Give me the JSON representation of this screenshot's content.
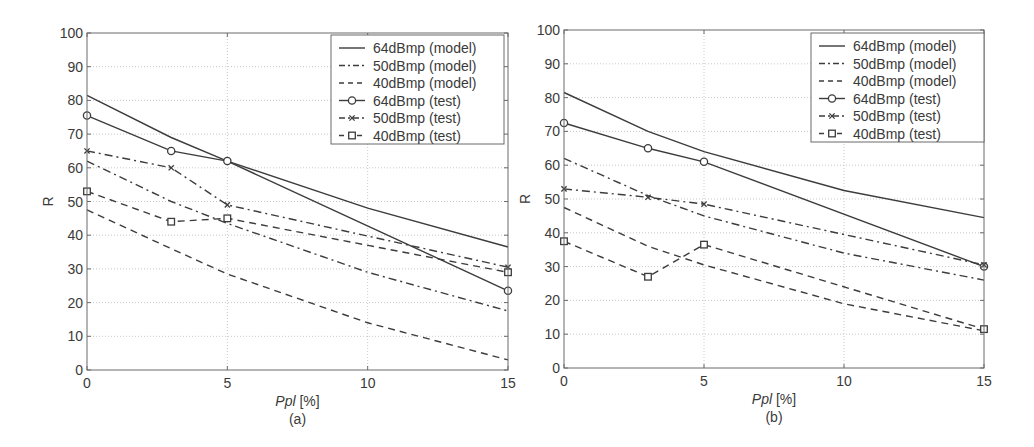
{
  "chart_data": [
    {
      "panel_label": "(a)",
      "type": "line",
      "title": "",
      "xlabel_italic": "Ppl",
      "xlabel_unit": " [%]",
      "ylabel": "R",
      "xlim": [
        0,
        15
      ],
      "ylim": [
        0,
        100
      ],
      "xticks": [
        0,
        5,
        10,
        15
      ],
      "yticks": [
        0,
        10,
        20,
        30,
        40,
        50,
        60,
        70,
        80,
        90,
        100
      ],
      "grid": true,
      "legend_position": "upper right",
      "series": [
        {
          "name": "64dBmp (model)",
          "style": "solid",
          "marker": "none",
          "x": [
            0,
            3,
            5,
            10,
            15
          ],
          "values": [
            81.5,
            69,
            62,
            48,
            36.5
          ]
        },
        {
          "name": "50dBmp (model)",
          "style": "dashdot",
          "marker": "none",
          "x": [
            0,
            3,
            5,
            10,
            15
          ],
          "values": [
            62,
            50,
            43.5,
            29,
            17.5
          ]
        },
        {
          "name": "40dBmp (model)",
          "style": "dashed",
          "marker": "none",
          "x": [
            0,
            3,
            5,
            10,
            15
          ],
          "values": [
            47.5,
            36,
            28.5,
            14,
            3
          ]
        },
        {
          "name": "64dBmp (test)",
          "style": "solid",
          "marker": "circle",
          "x": [
            0,
            3,
            5,
            15
          ],
          "values": [
            75.5,
            65,
            62,
            23.5
          ]
        },
        {
          "name": "50dBmp (test)",
          "style": "dashdot",
          "marker": "x",
          "x": [
            0,
            3,
            5,
            15
          ],
          "values": [
            65,
            60,
            49,
            30.5
          ]
        },
        {
          "name": "40dBmp (test)",
          "style": "dashed",
          "marker": "square",
          "x": [
            0,
            3,
            5,
            15
          ],
          "values": [
            53,
            44,
            45,
            29
          ]
        }
      ]
    },
    {
      "panel_label": "(b)",
      "type": "line",
      "title": "",
      "xlabel_italic": "Ppl",
      "xlabel_unit": " [%]",
      "ylabel": "R",
      "xlim": [
        0,
        15
      ],
      "ylim": [
        0,
        100
      ],
      "xticks": [
        0,
        5,
        10,
        15
      ],
      "yticks": [
        0,
        10,
        20,
        30,
        40,
        50,
        60,
        70,
        80,
        90,
        100
      ],
      "grid": true,
      "legend_position": "upper right",
      "series": [
        {
          "name": "64dBmp (model)",
          "style": "solid",
          "marker": "none",
          "x": [
            0,
            3,
            5,
            10,
            15
          ],
          "values": [
            81.5,
            70,
            64,
            52.5,
            44.5
          ]
        },
        {
          "name": "50dBmp (model)",
          "style": "dashdot",
          "marker": "none",
          "x": [
            0,
            3,
            5,
            10,
            15
          ],
          "values": [
            62,
            51,
            45,
            34,
            26
          ]
        },
        {
          "name": "40dBmp (model)",
          "style": "dashed",
          "marker": "none",
          "x": [
            0,
            3,
            5,
            10,
            15
          ],
          "values": [
            47.5,
            36,
            30.5,
            19,
            11
          ]
        },
        {
          "name": "64dBmp (test)",
          "style": "solid",
          "marker": "circle",
          "x": [
            0,
            3,
            5,
            15
          ],
          "values": [
            72.5,
            65,
            61,
            30
          ]
        },
        {
          "name": "50dBmp (test)",
          "style": "dashdot",
          "marker": "x",
          "x": [
            0,
            3,
            5,
            15
          ],
          "values": [
            53,
            50.5,
            48.5,
            30.5
          ]
        },
        {
          "name": "40dBmp (test)",
          "style": "dashed",
          "marker": "square",
          "x": [
            0,
            3,
            5,
            15
          ],
          "values": [
            37.5,
            27,
            36.5,
            11.5
          ]
        }
      ]
    }
  ],
  "colors": {
    "line": "#3c3c3c",
    "axis": "#6a6a6a",
    "grid": "#c8c8c8",
    "text": "#3a3a3a"
  },
  "layout": {
    "panels": [
      {
        "x0": 87,
        "x1": 508,
        "y0": 33,
        "y1": 370,
        "legend": {
          "x": 331,
          "y": 35,
          "w": 173,
          "h": 109
        }
      },
      {
        "x0": 564,
        "x1": 984,
        "y0": 30,
        "y1": 368,
        "legend": {
          "x": 811,
          "y": 33,
          "w": 173,
          "h": 109
        }
      }
    ]
  }
}
